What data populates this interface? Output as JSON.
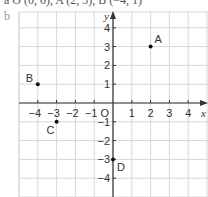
{
  "header": {
    "partial_line": "a  O (0, 0), A (2, 3), B (−4, 1)",
    "part_label": "b"
  },
  "chart_data": {
    "type": "scatter",
    "title": "",
    "xlabel": "x",
    "ylabel": "y",
    "xlim": [
      -5,
      5
    ],
    "ylim": [
      -5,
      5
    ],
    "grid": true,
    "x_ticks": [
      -4,
      -3,
      -2,
      -1,
      1,
      2,
      3,
      4
    ],
    "y_ticks": [
      4,
      3,
      2,
      1,
      -1,
      -2,
      -3,
      -4
    ],
    "origin_label": "O",
    "points": [
      {
        "label": "A",
        "x": 2,
        "y": 3
      },
      {
        "label": "B",
        "x": -4,
        "y": 1
      },
      {
        "label": "C",
        "x": -3,
        "y": -1
      },
      {
        "label": "D",
        "x": 0,
        "y": -3
      }
    ]
  },
  "colors": {
    "grid": "#d8d8d8",
    "axis": "#333333",
    "point": "#111111"
  }
}
